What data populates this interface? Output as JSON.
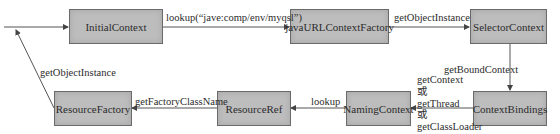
{
  "nodes": {
    "initial_context": "InitialContext",
    "java_url_context_factory": "javaURLContextFactory",
    "selector_context": "SelectorContext",
    "context_bindings": "ContextBindings",
    "naming_context": "NamingContext",
    "resource_ref": "ResourceRef",
    "resource_factory": "ResourceFactory"
  },
  "edges": {
    "initial_to_factory": "lookup(“jave:comp/env/myqsl”)",
    "factory_to_selector": "getObjectInstance",
    "selector_to_bindings": "getBoundContext",
    "bindings_to_naming": [
      "getContext",
      "或",
      "getThread",
      "或",
      "getClassLoader"
    ],
    "naming_to_ref": "lookup",
    "ref_to_factory": "getFactoryClassName",
    "factory_to_caller": "getObjectInstance"
  },
  "colors": {
    "box_fill": "#bdbdbd",
    "box_border": "#6a6a6a",
    "line": "#555555"
  }
}
